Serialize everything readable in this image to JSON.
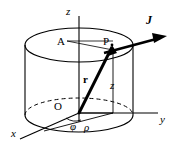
{
  "figure": {
    "background_color": "#ffffff",
    "stroke_color": "#000000",
    "width": 174,
    "height": 151
  },
  "axes": [
    {
      "id": "z",
      "label": "z",
      "style": "italic",
      "x": 66,
      "y": 6,
      "size": 11
    },
    {
      "id": "y",
      "label": "y",
      "style": "italic",
      "x": 160,
      "y": 114,
      "size": 11
    },
    {
      "id": "x",
      "label": "x",
      "style": "italic",
      "x": 11,
      "y": 128,
      "size": 11
    }
  ],
  "points": [
    {
      "id": "A",
      "label": "A",
      "style": "normal",
      "x": 57,
      "y": 36,
      "size": 11
    },
    {
      "id": "P",
      "label": "P",
      "style": "normal",
      "x": 103,
      "y": 36,
      "size": 11
    },
    {
      "id": "O",
      "label": "O",
      "style": "normal",
      "x": 54,
      "y": 101,
      "size": 11
    }
  ],
  "vectors": [
    {
      "id": "J",
      "label": "J",
      "style": "bold-italic",
      "x": 146,
      "y": 14,
      "size": 12
    },
    {
      "id": "r",
      "label": "r",
      "style": "bold",
      "x": 83,
      "y": 74,
      "size": 11
    }
  ],
  "coordinates": [
    {
      "id": "z-height",
      "label": "z",
      "style": "italic",
      "x": 110,
      "y": 80,
      "size": 11
    },
    {
      "id": "phi",
      "label": "φ",
      "style": "italic",
      "x": 70,
      "y": 121,
      "size": 11
    },
    {
      "id": "rho",
      "label": "ρ",
      "style": "italic",
      "x": 84,
      "y": 122,
      "size": 11
    }
  ]
}
